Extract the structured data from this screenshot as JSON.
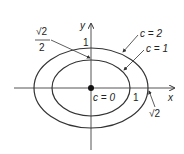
{
  "diagram": {
    "axes": {
      "x_label": "x",
      "y_label": "y"
    },
    "curves": [
      {
        "name": "level curve c=0",
        "label": "c = 0",
        "type": "point"
      },
      {
        "name": "level curve c=1",
        "label": "c = 1",
        "type": "ellipse"
      },
      {
        "name": "level curve c=2",
        "label": "c = 2",
        "type": "ellipse"
      }
    ],
    "annotations": {
      "y_intercept_inner": "1",
      "x_intercept_inner": "1",
      "sqrt2_over_2_num": "√2",
      "sqrt2_over_2_den": "2",
      "sqrt2": "√2"
    },
    "colors": {
      "stroke": "#333333",
      "background": "#ffffff"
    }
  }
}
